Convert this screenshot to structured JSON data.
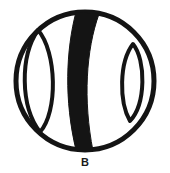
{
  "figure": {
    "label": "B",
    "colors": {
      "ink": "#141414",
      "background": "#ffffff"
    },
    "diagram": {
      "type": "line-drawing",
      "description": "Circle containing a thick curved vertical band through the center and two pointed-oval lens shapes at left and right",
      "outer_circle": {
        "center_x": 85,
        "center_y": 81,
        "radius": 70,
        "stroke_width": 5
      },
      "center_band": {
        "name": "center-band",
        "filled": true,
        "top_left_x": 76,
        "top_right_x": 99,
        "mid_left_x": 66,
        "mid_right_x": 89,
        "bottom_x": 83,
        "top_y": 12,
        "bottom_y": 151
      },
      "left_lens": {
        "name": "left-lens",
        "top_tip_x": 38,
        "top_tip_y": 30,
        "bottom_tip_x": 40,
        "bottom_tip_y": 132,
        "bulge_x": 62,
        "stroke_width": 4
      },
      "right_lens": {
        "name": "right-lens",
        "top_tip_x": 133,
        "top_tip_y": 44,
        "bottom_tip_x": 130,
        "bottom_tip_y": 121,
        "bulge_x": 148,
        "stroke_width": 4
      }
    }
  }
}
